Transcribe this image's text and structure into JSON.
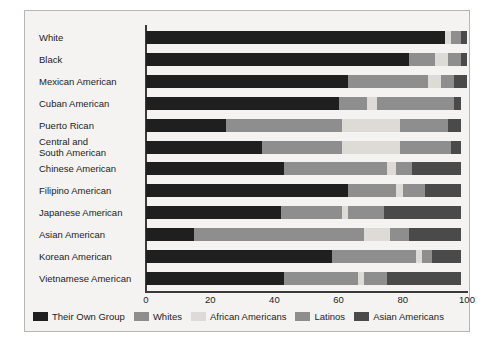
{
  "chart_data": {
    "type": "bar",
    "orientation": "horizontal",
    "stacked": true,
    "title": "",
    "xlabel": "",
    "ylabel": "",
    "xlim": [
      0,
      100
    ],
    "xticks": [
      0,
      20,
      40,
      60,
      80,
      100
    ],
    "grid": false,
    "legend_position": "bottom",
    "categories": [
      "White",
      "Black",
      "Mexican American",
      "Cuban American",
      "Puerto Rican",
      "Central and\nSouth American",
      "Chinese American",
      "Filipino American",
      "Japanese American",
      "Asian American",
      "Korean American",
      "Vietnamese American"
    ],
    "series": [
      {
        "name": "Their Own Group",
        "color": "#1f1f1f",
        "values": [
          93,
          82,
          63,
          60,
          25,
          36,
          43,
          63,
          42,
          15,
          58,
          43
        ]
      },
      {
        "name": "Whites",
        "color": "#8e8e8e",
        "values": [
          0,
          8,
          25,
          9,
          36,
          25,
          32,
          15,
          19,
          53,
          26,
          23
        ]
      },
      {
        "name": "African Americans",
        "color": "#dedbd6",
        "values": [
          2,
          4,
          4,
          3,
          18,
          18,
          3,
          2,
          2,
          8,
          2,
          2
        ]
      },
      {
        "name": "Latinos",
        "color": "#8e8e8e",
        "values": [
          3,
          4,
          4,
          24,
          15,
          16,
          5,
          7,
          11,
          6,
          3,
          7
        ]
      },
      {
        "name": "Asian Americans",
        "color": "#4a4a4a",
        "values": [
          2,
          2,
          4,
          2,
          4,
          3,
          15,
          11,
          24,
          16,
          9,
          23
        ]
      }
    ]
  },
  "legend": {
    "items": [
      {
        "label": "Their Own Group",
        "color": "#1f1f1f"
      },
      {
        "label": "Whites",
        "color": "#8e8e8e"
      },
      {
        "label": "African Americans",
        "color": "#dedbd6"
      },
      {
        "label": "Latinos",
        "color": "#8e8e8e"
      },
      {
        "label": "Asian Americans",
        "color": "#4a4a4a"
      }
    ]
  }
}
